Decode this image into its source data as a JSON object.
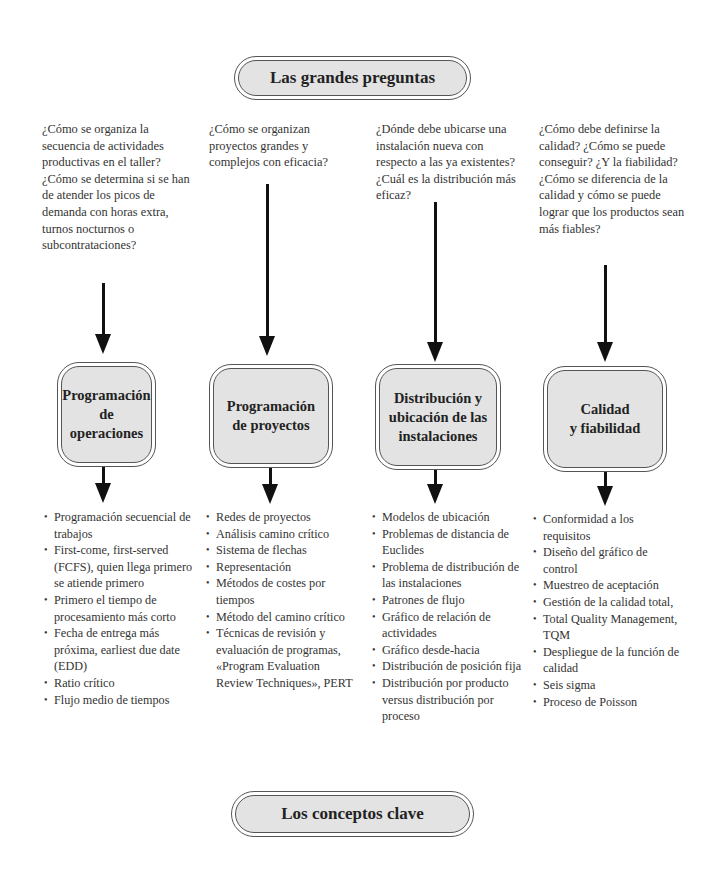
{
  "header": {
    "title": "Las grandes preguntas"
  },
  "footer": {
    "title": "Los conceptos clave"
  },
  "columns": [
    {
      "question": "¿Cómo se organiza la secuencia de actividades productivas en el taller? ¿Cómo se determina si se han de atender los picos de demanda con horas extra, turnos nocturnos o subcontrataciones?",
      "topic_line1": "Programación",
      "topic_line2": "de operaciones",
      "topic_line3": "",
      "concepts": [
        "Programación secuencial de trabajos",
        "First-come, first-served (FCFS), quien llega primero se atiende primero",
        "Primero el tiempo de procesamiento más corto",
        "Fecha de entrega más próxima, earliest due date (EDD)",
        "Ratio crítico",
        "Flujo medio de tiempos"
      ]
    },
    {
      "question": "¿Cómo se organizan proyectos grandes y complejos con eficacia?",
      "topic_line1": "Programación",
      "topic_line2": "de proyectos",
      "topic_line3": "",
      "concepts": [
        "Redes de proyectos",
        "Análisis camino crítico",
        "Sistema de flechas",
        "Representación",
        "Métodos de costes por tiempos",
        "Método del camino crítico",
        "Técnicas de revisión y evaluación de programas, «Program Evaluation Review Techniques», PERT"
      ]
    },
    {
      "question": "¿Dónde debe ubicarse una instalación nueva con respecto a las ya existentes? ¿Cuál es la distribución más eficaz?",
      "topic_line1": "Distribución y",
      "topic_line2": "ubicación de las",
      "topic_line3": "instalaciones",
      "concepts": [
        "Modelos de ubicación",
        "Problemas de distancia de Euclides",
        "Problema de distribución de las instalaciones",
        "Patrones de flujo",
        "Gráfico de relación de actividades",
        "Gráfico desde-hacia",
        "Distribución de posición fija",
        "Distribución por producto versus distribución por proceso"
      ]
    },
    {
      "question": "¿Cómo debe definirse la calidad? ¿Cómo se puede conseguir? ¿Y la fiabilidad? ¿Cómo se diferencia de la calidad y cómo se puede lograr que los productos sean más fiables?",
      "topic_line1": "Calidad",
      "topic_line2": "y fiabilidad",
      "topic_line3": "",
      "concepts": [
        "Conformidad a los requisitos",
        "Diseño del gráfico de control",
        "Muestreo de aceptación",
        "Gestión de la calidad total,",
        "Total Quality Management, TQM",
        "Despliegue de la función de calidad",
        "Seis sigma",
        "Proceso de Poisson"
      ]
    }
  ]
}
